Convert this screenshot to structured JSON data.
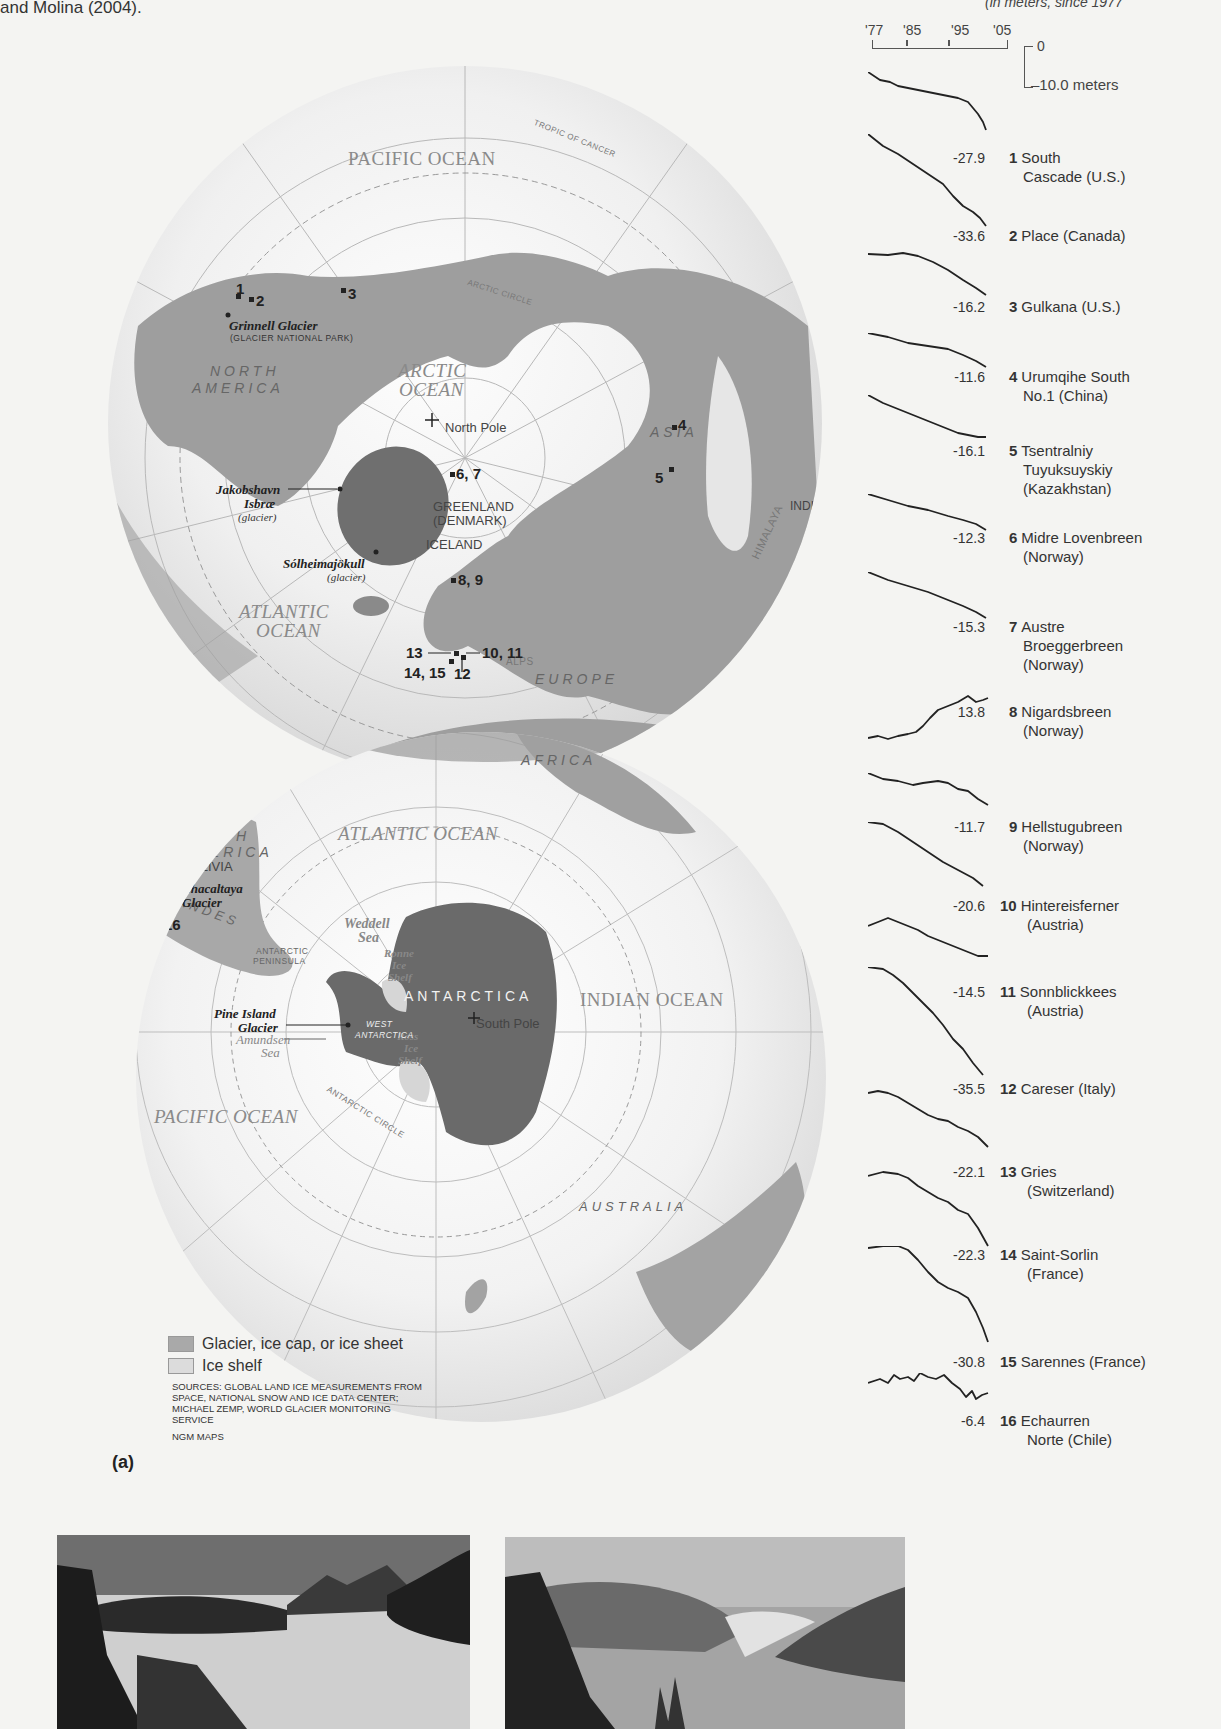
{
  "intro_text": "and Molina (2004).",
  "units_note": "(in meters, since 1977",
  "scale": {
    "years": [
      "'77",
      "'85",
      "'95",
      "'05"
    ],
    "zero_label": "0",
    "minus_label": "–10.0  meters"
  },
  "north_map": {
    "oceans": [
      "PACIFIC OCEAN",
      "ARCTIC",
      "OCEAN",
      "ATLANTIC",
      "OCEAN"
    ],
    "continents": {
      "na1": "NORTH",
      "na2": "AMERICA",
      "asia": "ASIA",
      "europe": "EUROPE",
      "africa": "AFRICA"
    },
    "places": {
      "greenland": "GREENLAND",
      "denmark": "(DENMARK)",
      "iceland": "ICELAND",
      "india": "INDIA",
      "himalaya": "HIMALAYA",
      "alps": "ALPS",
      "north_pole": "North Pole"
    },
    "lines": {
      "tropic_cancer": "TROPIC OF CANCER",
      "arctic_circle": "ARCTIC CIRCLE"
    },
    "glaciers": {
      "grinnell": "Grinnell Glacier",
      "grinnell_sub": "(GLACIER NATIONAL PARK)",
      "jakob1": "Jakobshavn",
      "jakob2": "Isbræ",
      "jakob_sub": "(glacier)",
      "solheim": "Sólheimajökull",
      "solheim_sub": "(glacier)"
    },
    "markers": [
      "1",
      "2",
      "3",
      "4",
      "5",
      "6, 7",
      "8, 9",
      "10, 11",
      "12",
      "13",
      "14, 15"
    ]
  },
  "south_map": {
    "oceans": {
      "atlantic": "ATLANTIC OCEAN",
      "indian": "INDIAN OCEAN",
      "pacific": "PACIFIC OCEAN"
    },
    "continents": {
      "sa1": "SOUTH",
      "sa2": "AMERICA",
      "antarctica": "ANTARCTICA",
      "africa": "AFRICA",
      "australia": "AUSTRALIA",
      "andes": "ANDES"
    },
    "places": {
      "bolivia": "BOLIVIA",
      "weddell1": "Weddell",
      "weddell2": "Sea",
      "ronne1": "Ronne",
      "ronne2": "Ice",
      "ronne3": "Shelf",
      "ross1": "Ross",
      "ross2": "Ice",
      "ross3": "Shelf",
      "amundsen1": "Amundsen",
      "amundsen2": "Sea",
      "peninsula1": "ANTARCTIC",
      "peninsula2": "PENINSULA",
      "west1": "WEST",
      "west2": "ANTARCTICA",
      "south_pole": "South Pole"
    },
    "lines": {
      "tropic_capricorn": "TROPIC OF CAPRICORN",
      "antarctic_circle": "ANTARCTIC CIRCLE"
    },
    "glaciers": {
      "chacaltaya1": "Chacaltaya",
      "chacaltaya2": "Glacier",
      "pine1": "Pine Island",
      "pine2": "Glacier"
    },
    "markers": [
      "16"
    ]
  },
  "legend": {
    "items": [
      {
        "label": "Glacier, ice cap, or ice sheet",
        "color": "#a9a9a9"
      },
      {
        "label": "Ice shelf",
        "color": "#dcdcdc"
      }
    ],
    "sources": "SOURCES: GLOBAL LAND ICE MEASUREMENTS FROM SPACE, NATIONAL SNOW AND ICE DATA CENTER; MICHAEL ZEMP, WORLD GLACIER MONITORING SERVICE",
    "credit": "NGM MAPS",
    "panel_label": "(a)"
  },
  "chart_data": {
    "type": "line",
    "xlabel": "Year",
    "ylabel": "meters",
    "x_ticks": [
      "'77",
      "'85",
      "'95",
      "'05"
    ],
    "xlim": [
      1977,
      2005
    ],
    "scale_bar": {
      "top": 0,
      "bottom": -10.0,
      "unit": "meters"
    },
    "grid": false,
    "series": [
      {
        "id": 1,
        "name": "South Cascade (U.S.)",
        "final": -27.9
      },
      {
        "id": 2,
        "name": "Place (Canada)",
        "final": -33.6
      },
      {
        "id": 3,
        "name": "Gulkana (U.S.)",
        "final": -16.2
      },
      {
        "id": 4,
        "name": "Urumqihe South No.1 (China)",
        "final": -11.6
      },
      {
        "id": 5,
        "name": "Tsentralniy Tuyuksuyskiy (Kazakhstan)",
        "final": -16.1
      },
      {
        "id": 6,
        "name": "Midre Lovenbreen (Norway)",
        "final": -12.3
      },
      {
        "id": 7,
        "name": "Austre Broeggerbreen (Norway)",
        "final": -15.3
      },
      {
        "id": 8,
        "name": "Nigardsbreen (Norway)",
        "final": 13.8
      },
      {
        "id": 9,
        "name": "Hellstugubreen (Norway)",
        "final": -11.7
      },
      {
        "id": 10,
        "name": "Hintereisferner (Austria)",
        "final": -20.6
      },
      {
        "id": 11,
        "name": "Sonnblickkees (Austria)",
        "final": -14.5
      },
      {
        "id": 12,
        "name": "Careser (Italy)",
        "final": -35.5
      },
      {
        "id": 13,
        "name": "Gries (Switzerland)",
        "final": -22.1
      },
      {
        "id": 14,
        "name": "Saint-Sorlin (France)",
        "final": -22.3
      },
      {
        "id": 15,
        "name": "Sarennes (France)",
        "final": -30.8
      },
      {
        "id": 16,
        "name": "Echaurren Norte (Chile)",
        "final": -6.4
      }
    ]
  },
  "sparklines": [
    {
      "num": "1",
      "line1": "South",
      "line2": "Cascade (U.S.)",
      "value": "-27.9",
      "path": "M0,0 L12,8 L22,10 L30,14 L40,16 L50,18 L60,20 L70,22 L80,24 L90,26 L100,30 L110,42 L115,50 L118,58",
      "top": 72,
      "lbl": 151
    },
    {
      "num": "2",
      "line1": "Place (Canada)",
      "line2": "",
      "value": "-33.6",
      "path": "M0,0 L15,12 L30,20 L45,30 L60,40 L75,50 L85,62 L95,72 L105,78 L112,84 L118,92",
      "top": 134,
      "lbl": 229
    },
    {
      "num": "3",
      "line1": "Gulkana (U.S.)",
      "line2": "",
      "value": "-16.2",
      "path": "M0,6 L20,7 L35,5 L50,8 L65,14 L80,22 L95,32 L108,40 L118,47",
      "top": 248,
      "lbl": 300
    },
    {
      "num": "4",
      "line1": "Urumqihe South",
      "line2": "No.1 (China)",
      "value": "-11.6",
      "path": "M0,0 L20,4 L40,10 L60,13 L80,16 L95,22 L108,28 L118,34",
      "top": 333,
      "lbl": 370
    },
    {
      "num": "5",
      "line1": "Tsentralniy",
      "line2": "Tuyuksuyskiy",
      "line3": "(Kazakhstan)",
      "value": "-16.1",
      "path": "M0,0 L15,8 L30,14 L45,20 L60,26 L75,32 L90,38 L100,40 L110,42 L118,42",
      "top": 395,
      "lbl": 444
    },
    {
      "num": "6",
      "line1": "Midre Lovenbreen",
      "line2": "(Norway)",
      "value": "-12.3",
      "path": "M0,0 L20,6 L40,12 L60,16 L80,22 L95,26 L108,30 L118,36",
      "top": 494,
      "lbl": 531
    },
    {
      "num": "7",
      "line1": "Austre",
      "line2": "Broeggerbreen",
      "line3": "(Norway)",
      "value": "-15.3",
      "path": "M0,0 L20,8 L40,14 L60,20 L80,28 L95,34 L108,40 L118,46",
      "top": 572,
      "lbl": 620
    },
    {
      "num": "8",
      "line1": "Nigardsbreen",
      "line2": "(Norway)",
      "value": "13.8",
      "path": "M0,48 L10,46 L20,49 L30,46 L40,44 L48,42 L55,36 L62,28 L70,20 L80,16 L90,12 L100,6 L108,12 L115,10 L120,8",
      "top": 690,
      "lbl": 705
    },
    {
      "num": "9",
      "line1": "Hellstugubreen",
      "line2": "(Norway)",
      "value": "-11.7",
      "path": "M0,0 L15,6 L30,8 L45,12 L55,10 L70,8 L80,10 L90,16 L100,18 L110,26 L120,32",
      "top": 773,
      "lbl": 820
    },
    {
      "num": "10",
      "line1": "Hintereisferner",
      "line2": "(Austria)",
      "value": "-20.6",
      "path": "M0,0 L15,2 L30,10 L45,20 L60,30 L75,40 L90,48 L105,56 L115,64",
      "top": 822,
      "lbl": 899
    },
    {
      "num": "11",
      "line1": "Sonnblickkees",
      "line2": "(Austria)",
      "value": "-14.5",
      "path": "M0,10 L10,6 L20,2 L30,6 L40,10 L50,14 L60,20 L70,24 L80,28 L90,32 L100,36 L110,40 L120,40",
      "top": 916,
      "lbl": 985
    },
    {
      "num": "12",
      "line1": "Careser (Italy)",
      "line2": "",
      "value": "-35.5",
      "path": "M0,0 L15,2 L25,8 L35,16 L45,26 L55,36 L65,46 L75,58 L85,72 L95,82 L105,96 L115,108",
      "top": 967,
      "lbl": 1082
    },
    {
      "num": "13",
      "line1": "Gries",
      "line2": "(Switzerland)",
      "value": "-22.1",
      "path": "M0,4 L10,2 L20,4 L30,8 L40,14 L50,20 L60,26 L70,30 L80,32 L90,38 L100,42 L110,48 L120,58",
      "top": 1089,
      "lbl": 1165
    },
    {
      "num": "14",
      "line1": "Saint-Sorlin",
      "line2": "(France)",
      "value": "-22.3",
      "path": "M0,6 L15,2 L30,4 L40,8 L50,16 L60,22 L70,28 L80,32 L90,40 L100,44 L110,58 L120,76",
      "top": 1170,
      "lbl": 1248
    },
    {
      "num": "15",
      "line1": "Sarennes (France)",
      "line2": "",
      "value": "-30.8",
      "path": "M0,2 L15,0 L30,0 L40,4 L50,14 L60,26 L70,36 L80,42 L90,46 L100,52 L108,66 L115,82 L120,96",
      "top": 1246,
      "lbl": 1355
    },
    {
      "num": "16",
      "line1": "Echaurren",
      "line2": "Norte (Chile)",
      "value": "-6.4",
      "path": "M0,10 L12,6 L20,10 L26,2 L32,6 L40,4 L46,8 L52,0 L60,4 L68,6 L76,2 L84,10 L92,16 L98,24 L104,18 L108,26 L114,22 L120,20",
      "top": 1373,
      "lbl": 1414
    }
  ],
  "photos": [
    {
      "alt": "Glacier valley photograph (earlier)"
    },
    {
      "alt": "Fjord with retreated glacier photograph (later)"
    }
  ]
}
